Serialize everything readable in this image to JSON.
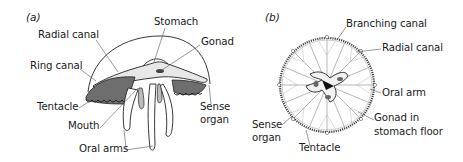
{
  "figure": {
    "panels": [
      {
        "tag": "(a)",
        "view": "side view",
        "labels": {
          "radial_canal": "Radial canal",
          "stomach": "Stomach",
          "gonad": "Gonad",
          "ring_canal": "Ring canal",
          "tentacle": "Tentacle",
          "mouth": "Mouth",
          "oral_arms": "Oral arms",
          "sense_organ_1": "Sense",
          "sense_organ_2": "organ"
        }
      },
      {
        "tag": "(b)",
        "view": "oral view",
        "labels": {
          "branching_canal": "Branching canal",
          "radial_canal": "Radial canal",
          "oral_arm": "Oral arm",
          "gonad_1": "Gonad in",
          "gonad_2": "stomach floor",
          "sense_organ_1": "Sense",
          "sense_organ_2": "organ",
          "tentacle": "Tentacle"
        }
      }
    ],
    "colors": {
      "ink": "#1a1a1a",
      "line": "#555555",
      "shade": "#7a7a7a",
      "background": "#ffffff"
    }
  }
}
